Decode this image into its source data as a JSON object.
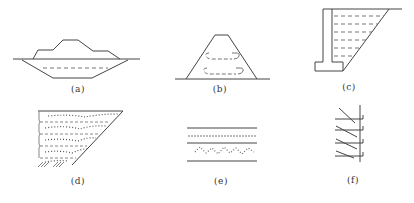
{
  "figure": {
    "panels": [
      {
        "id": "a",
        "label": "(a)",
        "x": 78,
        "y": 85,
        "description": "Embankment on ground with trench excavation below"
      },
      {
        "id": "b",
        "label": "(b)",
        "x": 220,
        "y": 84,
        "description": "Trapezoidal embankment with internal reinforcement layers"
      },
      {
        "id": "c",
        "label": "(c)",
        "x": 349,
        "y": 82,
        "description": "Cantilever retaining wall with layered backfill"
      },
      {
        "id": "d",
        "label": "(d)",
        "x": 78,
        "y": 176,
        "description": "Layered fill slope with gravel layers"
      },
      {
        "id": "e",
        "label": "(e)",
        "x": 221,
        "y": 176,
        "description": "Horizontal layered strata section"
      },
      {
        "id": "f",
        "label": "(f)",
        "x": 353,
        "y": 175,
        "description": "Vertical wall with inclined anchors"
      }
    ]
  },
  "colors": {
    "stroke": "#444444",
    "dashed": "#777777",
    "label": "#333333"
  }
}
